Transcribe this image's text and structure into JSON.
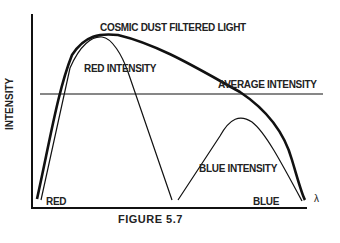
{
  "figure": {
    "caption": "FIGURE 5.7",
    "y_axis_label": "INTENSITY",
    "x_axis_end_symbol": "λ",
    "x_axis_left_label": "RED",
    "x_axis_right_label": "BLUE"
  },
  "curves": {
    "cosmic": "COSMIC DUST FILTERED LIGHT",
    "red": "RED INTENSITY",
    "average": "AVERAGE INTENSITY",
    "blue": "BLUE INTENSITY"
  },
  "colors": {
    "line": "#111111",
    "text": "#222222",
    "background": "#ffffff"
  }
}
